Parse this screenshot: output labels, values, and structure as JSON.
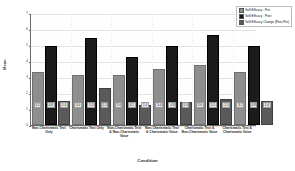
{
  "chart_data": {
    "type": "bar",
    "title": "",
    "xlabel": "Condition",
    "ylabel": "Mean",
    "ylim": [
      0,
      7
    ],
    "yticks": [
      0,
      1,
      2,
      3,
      4,
      5,
      6,
      7
    ],
    "grid": true,
    "legend_position": "top-right",
    "categories": [
      "Non-Charismatic Text Only",
      "Charismatic Text Only",
      "Non-Charismatic Text & Non-Charismatic Voice",
      "Non-Charismatic Text & Charismatic Voice",
      "Charismatic Text & Non-Charismatic Voice",
      "Charismatic Text & Charismatic Voice"
    ],
    "series": [
      {
        "name": "Self-Efficacy - Pre",
        "color": "#8e8e8e",
        "values": [
          3.2,
          3.0,
          3.0,
          3.4,
          3.6,
          3.2
        ],
        "labels": [
          "3.2",
          "3.0",
          "3.0",
          "3.4",
          "3.6",
          "3.2"
        ]
      },
      {
        "name": "Self-Efficacy - Post",
        "color": "#1b1b1b",
        "values": [
          4.8,
          5.3,
          4.1,
          4.8,
          5.5,
          4.8
        ],
        "labels": [
          "4.8",
          "5.3",
          "4.1",
          "4.8",
          "5.5",
          "4.8"
        ]
      },
      {
        "name": "Self-Efficacy Change (Post-Pre)",
        "color": "#5a5a5a",
        "values": [
          1.4,
          2.2,
          1.1,
          1.3,
          1.5,
          1.4
        ],
        "labels": [
          "1.4",
          "2.2",
          "1.1",
          "1.3",
          "1.5",
          "1.4"
        ]
      }
    ]
  }
}
